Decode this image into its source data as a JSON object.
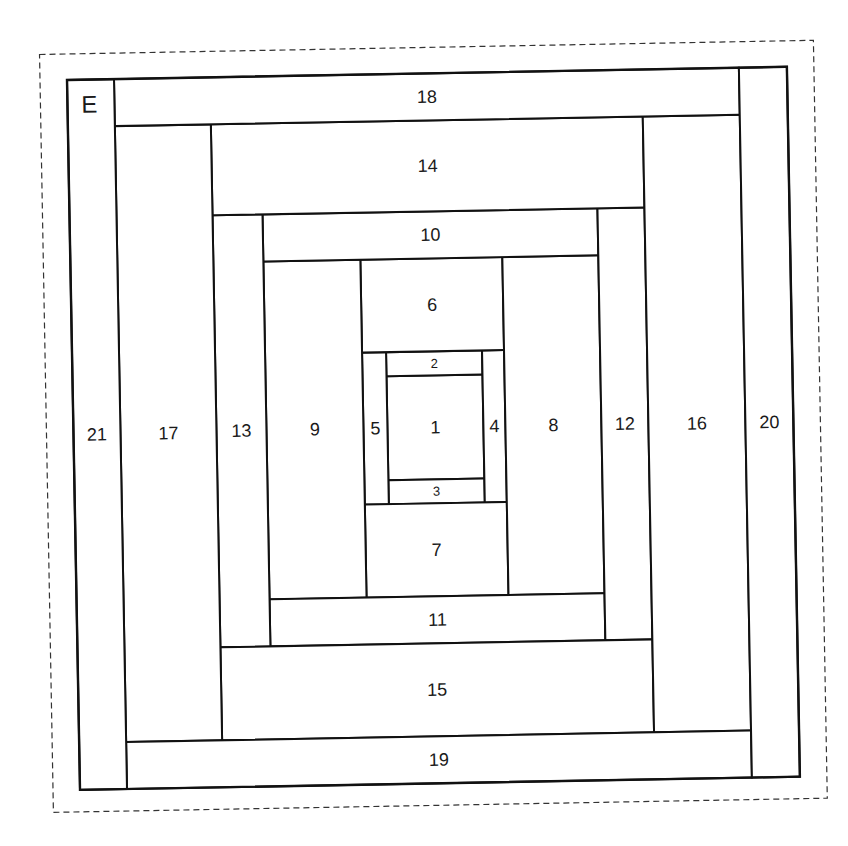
{
  "diagram": {
    "type": "log-cabin-quilt-block-foundation-pattern",
    "block_label": "E",
    "rotation_deg": -1.05,
    "colors": {
      "line": "#111111",
      "dashed_border": "#333333",
      "background": "#ffffff",
      "text": "#1a1a1a"
    },
    "outer_frame": {
      "x": 0,
      "y": 0,
      "w": 720,
      "h": 710
    },
    "pieces": [
      {
        "id": "1",
        "label": "1",
        "x": 314,
        "y": 302,
        "w": 96,
        "h": 104,
        "font": 18
      },
      {
        "id": "2",
        "label": "2",
        "x": 314,
        "y": 278,
        "w": 96,
        "h": 24,
        "font": 13
      },
      {
        "id": "3",
        "label": "3",
        "x": 314,
        "y": 406,
        "w": 96,
        "h": 24,
        "font": 13
      },
      {
        "id": "4",
        "label": "4",
        "x": 410,
        "y": 278,
        "w": 22,
        "h": 152,
        "font": 18
      },
      {
        "id": "5",
        "label": "5",
        "x": 290,
        "y": 278,
        "w": 24,
        "h": 152,
        "font": 18
      },
      {
        "id": "6",
        "label": "6",
        "x": 290,
        "y": 185,
        "w": 142,
        "h": 93,
        "font": 18
      },
      {
        "id": "7",
        "label": "7",
        "x": 290,
        "y": 430,
        "w": 142,
        "h": 93,
        "font": 18
      },
      {
        "id": "8",
        "label": "8",
        "x": 432,
        "y": 185,
        "w": 96,
        "h": 338,
        "font": 18
      },
      {
        "id": "9",
        "label": "9",
        "x": 193,
        "y": 185,
        "w": 97,
        "h": 338,
        "font": 18
      },
      {
        "id": "10",
        "label": "10",
        "x": 193,
        "y": 138,
        "w": 335,
        "h": 47,
        "font": 18
      },
      {
        "id": "11",
        "label": "11",
        "x": 193,
        "y": 523,
        "w": 335,
        "h": 47,
        "font": 18
      },
      {
        "id": "12",
        "label": "12",
        "x": 528,
        "y": 138,
        "w": 47,
        "h": 432,
        "font": 18
      },
      {
        "id": "13",
        "label": "13",
        "x": 143,
        "y": 138,
        "w": 50,
        "h": 432,
        "font": 18
      },
      {
        "id": "14",
        "label": "14",
        "x": 143,
        "y": 47,
        "w": 432,
        "h": 91,
        "font": 18
      },
      {
        "id": "15",
        "label": "15",
        "x": 143,
        "y": 570,
        "w": 432,
        "h": 93,
        "font": 18
      },
      {
        "id": "16",
        "label": "16",
        "x": 575,
        "y": 47,
        "w": 97,
        "h": 616,
        "font": 18
      },
      {
        "id": "17",
        "label": "17",
        "x": 47,
        "y": 47,
        "w": 96,
        "h": 616,
        "font": 18
      },
      {
        "id": "18",
        "label": "18",
        "x": 47,
        "y": 0,
        "w": 625,
        "h": 47,
        "font": 18
      },
      {
        "id": "19",
        "label": "19",
        "x": 47,
        "y": 663,
        "w": 625,
        "h": 47,
        "font": 18
      },
      {
        "id": "20",
        "label": "20",
        "x": 672,
        "y": 0,
        "w": 48,
        "h": 710,
        "font": 18
      },
      {
        "id": "21",
        "label": "21",
        "x": 0,
        "y": 0,
        "w": 47,
        "h": 710,
        "font": 18
      }
    ]
  }
}
